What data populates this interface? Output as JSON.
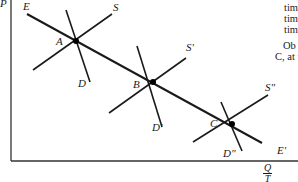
{
  "figure": {
    "axes": {
      "y_label": "P",
      "x_label_numerator": "Q",
      "x_label_denominator": "T"
    },
    "expansion_path": {
      "start_label": "E",
      "end_label": "E'"
    },
    "equilibria": [
      {
        "point": "A",
        "supply": "S",
        "demand": "D"
      },
      {
        "point": "B",
        "supply": "S'",
        "demand": "D'"
      },
      {
        "point": "C",
        "supply": "S\"",
        "demand": "D\""
      }
    ],
    "colors": {
      "line": "#1a1a1a",
      "background": "#ffffff"
    }
  },
  "side_text": {
    "lines": [
      "tim",
      "tim",
      "tim"
    ],
    "para_start": "Ob",
    "para_line2": "C, at t"
  }
}
